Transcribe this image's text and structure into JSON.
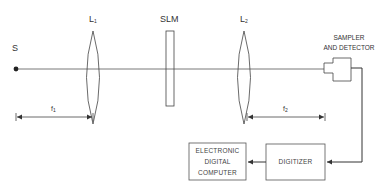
{
  "diagram": {
    "source": {
      "label": "S"
    },
    "lens1": {
      "label": "L",
      "subscript": "1"
    },
    "slm": {
      "label": "SLM"
    },
    "lens2": {
      "label": "L",
      "subscript": "2"
    },
    "detector": {
      "label_line1": "SAMPLER",
      "label_line2": "AND DETECTOR"
    },
    "focal1": {
      "label": "f",
      "subscript": "1"
    },
    "focal2": {
      "label": "f",
      "subscript": "2"
    },
    "digitizer": {
      "label": "DIGITIZER"
    },
    "computer": {
      "label_line1": "ELECTRONIC",
      "label_line2": "DIGITAL",
      "label_line3": "COMPUTER"
    },
    "colors": {
      "line": "#333333",
      "background": "#ffffff"
    }
  }
}
